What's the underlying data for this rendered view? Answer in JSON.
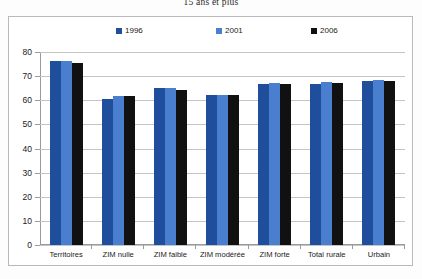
{
  "chart_data": {
    "type": "bar",
    "title": "15 ans et plus",
    "xlabel": "",
    "ylabel": "",
    "ylim": [
      0,
      80
    ],
    "yticks": [
      0,
      10,
      20,
      30,
      40,
      50,
      60,
      70,
      80
    ],
    "grid": true,
    "legend_position": "top",
    "categories": [
      "Territoires",
      "ZIM nulle",
      "ZIM faible",
      "ZIM modérée",
      "ZIM forte",
      "Total rurale",
      "Urbain"
    ],
    "series": [
      {
        "name": "1996",
        "color": "#1F4E9C",
        "values": [
          76.3,
          60.5,
          65.2,
          62.0,
          66.8,
          66.6,
          68.0
        ]
      },
      {
        "name": "2001",
        "color": "#4A7FD0",
        "values": [
          76.1,
          61.8,
          65.0,
          62.0,
          67.2,
          67.4,
          68.2
        ]
      },
      {
        "name": "2006",
        "color": "#111111",
        "values": [
          75.4,
          61.6,
          64.3,
          62.0,
          66.6,
          67.2,
          68.1
        ]
      }
    ]
  },
  "legend": {
    "items": [
      {
        "label": "1996",
        "color": "#1F4E9C"
      },
      {
        "label": "2001",
        "color": "#4A7FD0"
      },
      {
        "label": "2006",
        "color": "#111111"
      }
    ]
  },
  "axis": {
    "y_labels": [
      "80",
      "70",
      "60",
      "50",
      "40",
      "30",
      "20",
      "10",
      "0"
    ]
  }
}
